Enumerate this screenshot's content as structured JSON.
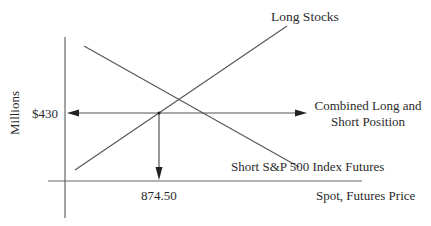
{
  "diagram": {
    "title": "",
    "y_axis_label": "Millions",
    "x_axis_label": "Spot, Futures Price",
    "y_tick_label": "$430",
    "x_tick_label": "874.50",
    "lines": [
      {
        "name": "Long Stocks",
        "label": "Long Stocks",
        "slope": "positive"
      },
      {
        "name": "Short S&P 500 Index Futures",
        "label": "Short S&P 500 Index Futures",
        "slope": "negative"
      }
    ],
    "combined_label_line1": "Combined Long and",
    "combined_label_line2": "Short Position",
    "colors": {
      "line": "#555555",
      "arrow": "#222222",
      "text": "#2a2a2a"
    }
  }
}
